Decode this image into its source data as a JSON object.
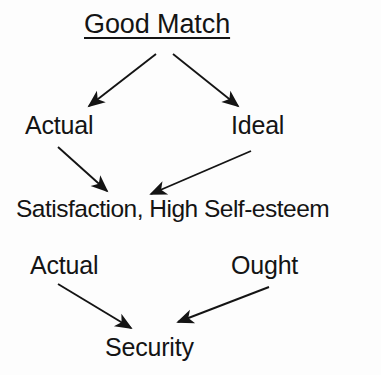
{
  "diagram": {
    "title": "Good Match",
    "background_color": "#fdfdfd",
    "ink_color": "#141414",
    "nodes": {
      "title": "Good Match",
      "actual_upper": "Actual",
      "ideal": "Ideal",
      "satisfaction": "Satisfaction, High Self-esteem",
      "actual_lower": "Actual",
      "ought": "Ought",
      "security": "Security"
    },
    "edges": [
      {
        "from": "Good Match",
        "to": "Actual",
        "direction": "down-left"
      },
      {
        "from": "Good Match",
        "to": "Ideal",
        "direction": "down-right"
      },
      {
        "from": "Actual",
        "to": "Satisfaction, High Self-esteem",
        "direction": "down-right"
      },
      {
        "from": "Ideal",
        "to": "Satisfaction, High Self-esteem",
        "direction": "down-left"
      },
      {
        "from": "Actual",
        "to": "Security",
        "direction": "down-right"
      },
      {
        "from": "Ought",
        "to": "Security",
        "direction": "down-left"
      }
    ]
  }
}
